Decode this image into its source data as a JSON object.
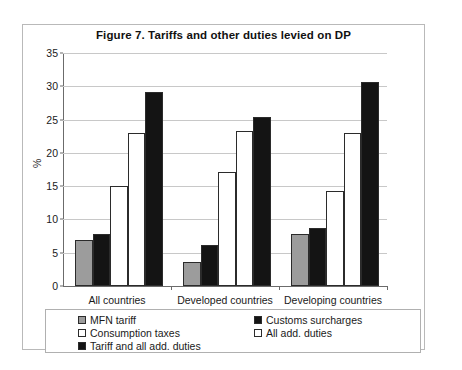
{
  "chart_data": {
    "type": "bar",
    "title": "Figure 7.  Tariffs and other duties levied on DP",
    "xlabel": "",
    "ylabel": "%",
    "ylim": [
      0,
      35
    ],
    "ytick_step": 5,
    "yticks": [
      0,
      5,
      10,
      15,
      20,
      25,
      30,
      35
    ],
    "grid": true,
    "legend_position": "bottom",
    "categories": [
      "All countries",
      "Developed countries",
      "Developing countries"
    ],
    "series": [
      {
        "name": "MFN tariff",
        "color": "#9c9c9c",
        "values": [
          6.9,
          3.6,
          7.8
        ]
      },
      {
        "name": "Customs surcharges",
        "color": "#141414",
        "values": [
          7.8,
          6.1,
          8.7
        ]
      },
      {
        "name": "Consumption taxes",
        "color": "#ffffff",
        "values": [
          15.0,
          17.2,
          14.3
        ]
      },
      {
        "name": "All add. duties",
        "color": "#ffffff",
        "values": [
          23.0,
          23.3,
          23.0
        ]
      },
      {
        "name": "Tariff and all add. duties",
        "color": "#141414",
        "values": [
          29.1,
          25.4,
          30.7
        ]
      }
    ]
  },
  "legend": {
    "columns": [
      [
        {
          "label": "MFN tariff",
          "swatch": "gray"
        },
        {
          "label": "Consumption taxes",
          "swatch": "white"
        },
        {
          "label": "Tariff and all add. duties",
          "swatch": "black"
        }
      ],
      [
        {
          "label": "Customs surcharges",
          "swatch": "black"
        },
        {
          "label": "All add. duties",
          "swatch": "white"
        }
      ]
    ]
  }
}
